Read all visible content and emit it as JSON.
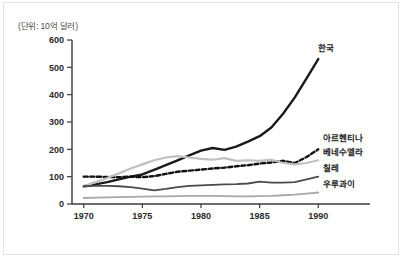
{
  "figure": {
    "unit_note": "(단위: 10억 달러)"
  },
  "chart_data": {
    "type": "line",
    "title": "",
    "subtitle": "",
    "xlabel": "",
    "ylabel": "",
    "unit_note": "(단위: 10억 달러)",
    "grid": false,
    "legend_position": "right-inline-labels",
    "xlim": [
      1969,
      1991
    ],
    "ylim": [
      0,
      600
    ],
    "x_ticks": [
      1970,
      1975,
      1980,
      1985,
      1990
    ],
    "x_tick_labels": [
      "1970",
      "1975",
      "1980",
      "1985",
      "1990"
    ],
    "y_ticks": [
      0,
      100,
      200,
      300,
      400,
      500,
      600
    ],
    "y_tick_labels": [
      "0",
      "100",
      "200",
      "300",
      "400",
      "500",
      "600"
    ],
    "x": [
      1970,
      1971,
      1972,
      1973,
      1974,
      1975,
      1976,
      1977,
      1978,
      1979,
      1980,
      1981,
      1982,
      1983,
      1984,
      1985,
      1986,
      1987,
      1988,
      1989,
      1990
    ],
    "series": [
      {
        "name": "한국",
        "label": "한국",
        "color": "#1a1a1a",
        "style": "solid-thick",
        "values": [
          65,
          72,
          80,
          90,
          100,
          108,
          125,
          142,
          160,
          178,
          195,
          205,
          198,
          210,
          228,
          248,
          280,
          330,
          390,
          460,
          530
        ]
      },
      {
        "name": "아르헨티나",
        "label": "아르헨티나",
        "color": "#111111",
        "style": "dashed",
        "values": [
          100,
          100,
          99,
          98,
          100,
          98,
          102,
          110,
          118,
          122,
          126,
          130,
          133,
          138,
          142,
          148,
          152,
          158,
          150,
          172,
          200
        ]
      },
      {
        "name": "베네수엘라",
        "label": "베네수엘라",
        "color": "#c0c0c0",
        "style": "solid-light",
        "values": [
          65,
          80,
          95,
          112,
          130,
          145,
          160,
          170,
          175,
          170,
          165,
          162,
          168,
          158,
          160,
          158,
          162,
          150,
          145,
          150,
          160
        ]
      },
      {
        "name": "칠레",
        "label": "칠레",
        "color": "#4a4a4a",
        "style": "solid-medium",
        "values": [
          65,
          66,
          66,
          65,
          62,
          56,
          50,
          55,
          62,
          66,
          68,
          70,
          72,
          73,
          75,
          82,
          78,
          78,
          80,
          90,
          100
        ]
      },
      {
        "name": "우루과이",
        "label": "우루과이",
        "color": "#a8a8a8",
        "style": "solid-light-flat",
        "values": [
          22,
          23,
          24,
          25,
          26,
          27,
          28,
          28,
          29,
          30,
          30,
          30,
          29,
          28,
          28,
          29,
          30,
          32,
          34,
          38,
          42
        ]
      }
    ],
    "annotations": [
      {
        "text": "한국",
        "x": 1990,
        "y": 560
      },
      {
        "text": "아르헨티나",
        "x": 1990.4,
        "y": 230
      },
      {
        "text": "베네수엘라",
        "x": 1990.4,
        "y": 178
      },
      {
        "text": "칠레",
        "x": 1990.4,
        "y": 122
      },
      {
        "text": "우루과이",
        "x": 1990.4,
        "y": 62
      }
    ]
  }
}
